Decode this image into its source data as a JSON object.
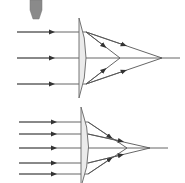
{
  "diagram": {
    "colors": {
      "background": "#ffffff",
      "ray": "#555555",
      "lens_fill": "#e8e8e8",
      "lens_stroke": "#666666",
      "pointer": "#8a8a8a"
    },
    "top_panel": {
      "rays_y": [
        32,
        58,
        84
      ],
      "axis_y": 58,
      "lens_x": 80,
      "paraxial_focus_x": 162,
      "marginal_focus_x": 120
    },
    "bottom_panel": {
      "rays_y": [
        122,
        134,
        148,
        163,
        174
      ],
      "axis_y": 148,
      "lens_x": 80,
      "paraxial_focus_x": 150,
      "marginal_focus_x": 127
    },
    "pointer_icon": "pencil-tip"
  }
}
